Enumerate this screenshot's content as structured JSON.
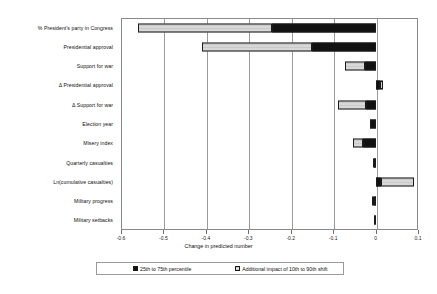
{
  "chart_data": {
    "type": "bar",
    "orientation": "horizontal",
    "title": "",
    "xlabel": "Change in predicted number",
    "ylabel": "",
    "xlim": [
      -0.6,
      0.1
    ],
    "xticks": [
      -0.6,
      -0.5,
      -0.4,
      -0.3,
      -0.2,
      -0.1,
      0,
      0.1
    ],
    "xticklabels": [
      "-0.6",
      "-0.5",
      "-0.4",
      "-0.3",
      "-0.2",
      "-0.1",
      "0",
      "0.1"
    ],
    "grid": true,
    "grid_axis": "x",
    "legend_position": "bottom",
    "stacked": true,
    "categories": [
      "% President's party in Congress",
      "Presidential approval",
      "Support for war",
      "Δ Presidential approval",
      "Δ Support for war",
      "Election year",
      "Misery index",
      "Quarterly casualties",
      "Ln(cumulative casualties)",
      "Military progress",
      "Military setbacks"
    ],
    "series": [
      {
        "name": "25th to 75th percentile",
        "color": "#111111",
        "fill": "solid",
        "values": [
          -0.245,
          -0.15,
          -0.026,
          0.01,
          -0.022,
          -0.014,
          -0.03,
          -0.004,
          0.012,
          -0.004,
          -0.003
        ]
      },
      {
        "name": "Additional impact of 10th to 90th shift",
        "color": "#c9c9c9",
        "fill": "hatched",
        "values": [
          -0.315,
          -0.26,
          -0.046,
          0.008,
          -0.066,
          0.0,
          -0.024,
          -0.003,
          0.078,
          -0.005,
          0.0
        ]
      }
    ],
    "totals": [
      -0.56,
      -0.41,
      -0.072,
      0.018,
      -0.088,
      -0.014,
      -0.054,
      -0.007,
      0.09,
      -0.009,
      -0.003
    ]
  },
  "legend": {
    "entries": [
      {
        "label": "25th to 75th percentile",
        "swatch": "dark"
      },
      {
        "label": "Additional impact of 10th to 90th shift",
        "swatch": "hatched"
      }
    ]
  }
}
